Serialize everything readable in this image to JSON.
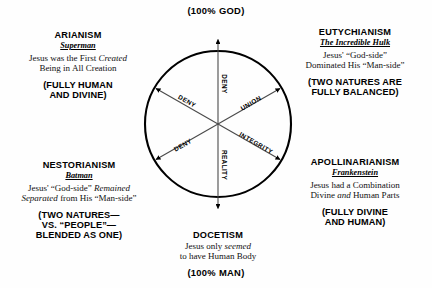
{
  "poles": {
    "top": "(100% GOD)",
    "bottom": "(100% MAN)"
  },
  "circle": {
    "center_x": 218,
    "center_y": 124,
    "radius": 73,
    "stroke": "#000000"
  },
  "spokes": [
    {
      "name": "deny-up",
      "label": "DENY",
      "angle_deg": -90
    },
    {
      "name": "deny-upper-left",
      "label": "DENY",
      "angle_deg": -150
    },
    {
      "name": "union-upper-right",
      "label": "UNION",
      "angle_deg": -30
    },
    {
      "name": "deny-lower-left",
      "label": "DENY",
      "angle_deg": 150
    },
    {
      "name": "integrity-lower-right",
      "label": "INTEGRITY",
      "angle_deg": 30
    },
    {
      "name": "reality-down",
      "label": "REALITY",
      "angle_deg": 90
    }
  ],
  "heresies": {
    "arianism": {
      "heading": "ARIANISM",
      "nickname": "Superman",
      "desc_line1_pre": "Jesus was the First ",
      "desc_line1_em": "Created",
      "desc_line1_post": "",
      "desc_line2": "Being in All Creation",
      "tagline_line1": "(FULLY HUMAN",
      "tagline_line2": "AND DIVINE)"
    },
    "eutychianism": {
      "heading": "EUTYCHIANISM",
      "nickname": "The Incredible Hulk",
      "desc_line1": "Jesus' “God-side”",
      "desc_line2": "Dominated His “Man-side”",
      "tagline_line1": "(TWO NATURES ARE",
      "tagline_line2": "FULLY BALANCED)"
    },
    "nestorianism": {
      "heading": "NESTORIANISM",
      "nickname": "Batman",
      "desc_line1_pre": "Jesus' “God-side” ",
      "desc_line1_em": "Remained",
      "desc_line2_em": "Separated",
      "desc_line2_post": " from His “Man-side”",
      "tagline_line1": "(TWO NATURES—",
      "tagline_line2": "VS. “PEOPLE”—",
      "tagline_line3": "BLENDED AS ONE)"
    },
    "apollinarianism": {
      "heading": "APOLLINARIANISM",
      "nickname": "Frankenstein",
      "desc_line1": "Jesus had a Combination",
      "desc_line2_pre": "Divine ",
      "desc_line2_em": "and",
      "desc_line2_post": " Human Parts",
      "tagline_line1": "(FULLY DIVINE",
      "tagline_line2": "AND HUMAN)"
    },
    "docetism": {
      "heading": "DOCETISM",
      "desc_line1_pre": "Jesus only ",
      "desc_line1_em": "seemed",
      "desc_line2": "to have Human Body"
    }
  }
}
